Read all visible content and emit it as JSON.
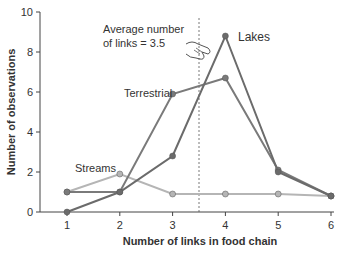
{
  "chart_data": {
    "type": "line",
    "title": "",
    "xlabel": "Number of links in food chain",
    "ylabel": "Number of observations",
    "x": [
      1,
      2,
      3,
      4,
      5,
      6
    ],
    "xlim": [
      0.5,
      6.1
    ],
    "ylim": [
      0,
      10
    ],
    "xticks": [
      1,
      2,
      3,
      4,
      5,
      6
    ],
    "yticks": [
      0,
      2,
      4,
      6,
      8,
      10
    ],
    "grid": false,
    "legend": "inline labels",
    "series": [
      {
        "name": "Lakes",
        "color": "#6b6b6b",
        "values": [
          0,
          1,
          2.8,
          8.8,
          2,
          0.8
        ]
      },
      {
        "name": "Terrestrial",
        "color": "#7a7a7a",
        "values": [
          1,
          1,
          5.9,
          6.7,
          2.1,
          0.8
        ]
      },
      {
        "name": "Streams",
        "color": "#b5b5b5",
        "values": [
          1,
          1.9,
          0.9,
          0.9,
          0.9,
          0.8
        ]
      }
    ],
    "annotations": [
      {
        "text_line1": "Average number",
        "text_line2": "of links = 3.5",
        "x": 3.5,
        "style": "dashed vertical line"
      }
    ]
  }
}
